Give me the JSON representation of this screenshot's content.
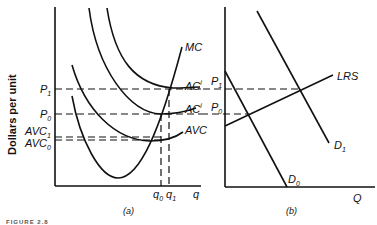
{
  "panel_a": {
    "caption": "(a)",
    "y_axis_title": "Dollars per unit",
    "x_axis_label": "q",
    "price_labels": {
      "p1": "P",
      "p1_sub": "1",
      "p0": "P",
      "p0_sub": "0",
      "avc1": "AVC",
      "avc1_sub": "1",
      "avc0": "AVC",
      "avc0_sub": "0"
    },
    "curve_labels": {
      "mc": "MC",
      "ac_upper": "AC",
      "ac_upper_sup": "i",
      "ac_lower": "AC",
      "ac_lower_sup": "i",
      "avc": "AVC"
    },
    "quantity_labels": {
      "q0": "q",
      "q0_sub": "0",
      "q1": "q",
      "q1_sub": "1"
    }
  },
  "panel_b": {
    "caption": "(b)",
    "x_axis_label": "Q",
    "price_labels": {
      "p1": "P",
      "p1_sub": "1",
      "p0": "P",
      "p0_sub": "0"
    },
    "curve_labels": {
      "lrs": "LRS",
      "d0": "D",
      "d0_sub": "0",
      "d1": "D",
      "d1_sub": "1"
    }
  },
  "figure_label": "FIGURE 2.8"
}
